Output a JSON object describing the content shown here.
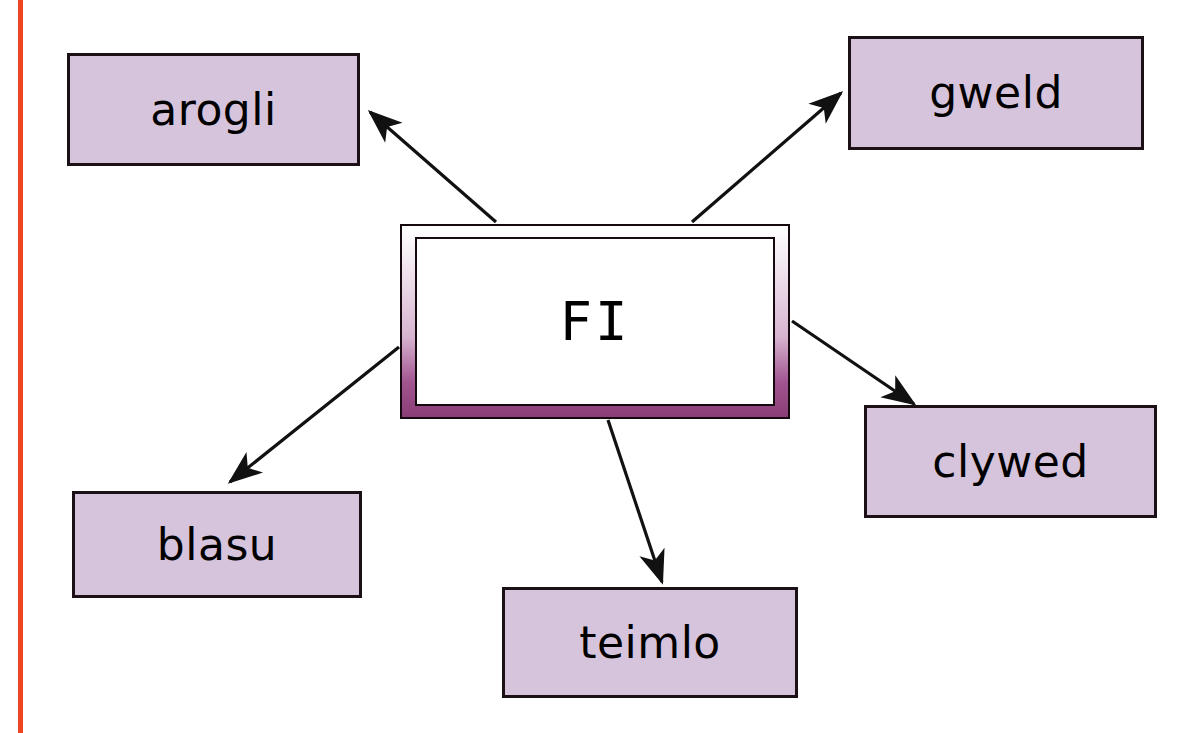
{
  "page": {
    "title": "FI",
    "margin_rule_color": "#ee4422",
    "background_color": "#ffffff"
  },
  "diagram": {
    "type": "mind-map",
    "center": {
      "label": "FI",
      "fill": "#ffffff",
      "frame_gradient_from": "#ffffff",
      "frame_gradient_to": "#8b3d76",
      "border_color": "#15090f"
    },
    "node_fill": "#d6c3dc",
    "node_border": "#1a1016",
    "edge_color": "#111111",
    "nodes": [
      {
        "id": "arogli",
        "label": "arogli",
        "position": "top-left"
      },
      {
        "id": "gweld",
        "label": "gweld",
        "position": "top-right"
      },
      {
        "id": "clywed",
        "label": "clywed",
        "position": "right"
      },
      {
        "id": "blasu",
        "label": "blasu",
        "position": "bottom-left"
      },
      {
        "id": "teimlo",
        "label": "teimlo",
        "position": "bottom"
      }
    ],
    "edges": [
      {
        "from": "center",
        "to": "arogli",
        "arrowhead": "to"
      },
      {
        "from": "center",
        "to": "gweld",
        "arrowhead": "to"
      },
      {
        "from": "center",
        "to": "clywed",
        "arrowhead": "to"
      },
      {
        "from": "center",
        "to": "blasu",
        "arrowhead": "to"
      },
      {
        "from": "center",
        "to": "teimlo",
        "arrowhead": "to"
      }
    ]
  }
}
